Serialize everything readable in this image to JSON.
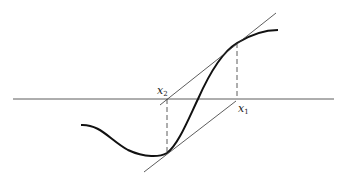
{
  "diagram": {
    "labels": {
      "x1": {
        "base": "x",
        "sub": "1"
      },
      "x2": {
        "base": "x",
        "sub": "2"
      }
    },
    "elements": [
      "x-axis",
      "curve",
      "tangent-line-at-x1-point",
      "tangent-line-at-x2-point",
      "dashed-drop-x1",
      "dashed-drop-x2"
    ],
    "colors": {
      "stroke": "#222222",
      "background": "#ffffff"
    }
  }
}
